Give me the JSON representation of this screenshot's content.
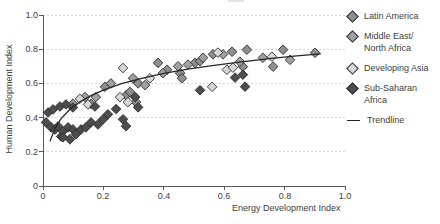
{
  "axes": {
    "x_title": "Energy Development Index",
    "y_title": "Human Development Index",
    "x_ticks": [
      "0",
      "0.2",
      "0.4",
      "0.6",
      "0.8",
      "1.0"
    ],
    "y_ticks": [
      "1.0",
      "0.8",
      "0.6",
      "0.4",
      "0.2",
      "0"
    ]
  },
  "legend": {
    "items": [
      {
        "label": "Latin America",
        "color": "#8e8e8e",
        "marker": "diamond"
      },
      {
        "label": "Middle East/\nNorth Africa",
        "color": "#a0a0a0",
        "marker": "diamond"
      },
      {
        "label": "Developing Asia",
        "color": "#d7d7d7",
        "marker": "diamond"
      },
      {
        "label": "Sub-Saharan\nAfrica",
        "color": "#4d4d4d",
        "marker": "diamond"
      },
      {
        "label": "Trendline",
        "color": "#262626",
        "marker": "line"
      }
    ]
  },
  "colors": {
    "axis": "#595959",
    "gridline": "#d8d8d8",
    "point_border": "#2e2e2e",
    "trendline": "#262626",
    "text": "#404040"
  },
  "chart_data": {
    "type": "scatter",
    "title": "",
    "xlabel": "Energy Development Index",
    "ylabel": "Human Development Index",
    "xlim": [
      0,
      1.0
    ],
    "ylim": [
      0,
      1.0
    ],
    "x_tick_values": [
      0,
      0.2,
      0.4,
      0.6,
      0.8,
      1.0
    ],
    "y_tick_values": [
      0,
      0.2,
      0.4,
      0.6,
      0.8,
      1.0
    ],
    "grid": "horizontal-dashed",
    "legend_position": "right",
    "marker": "diamond",
    "series": [
      {
        "name": "Latin America",
        "color": "#8e8e8e",
        "points": [
          [
            0.159,
            0.48
          ],
          [
            0.205,
            0.58
          ],
          [
            0.275,
            0.53
          ],
          [
            0.288,
            0.55
          ],
          [
            0.308,
            0.49
          ],
          [
            0.315,
            0.6
          ],
          [
            0.381,
            0.72
          ],
          [
            0.411,
            0.68
          ],
          [
            0.454,
            0.66
          ],
          [
            0.46,
            0.63
          ],
          [
            0.503,
            0.72
          ],
          [
            0.52,
            0.73
          ],
          [
            0.563,
            0.77
          ],
          [
            0.626,
            0.785
          ],
          [
            0.662,
            0.698
          ],
          [
            0.675,
            0.797
          ],
          [
            0.762,
            0.698
          ],
          [
            0.795,
            0.797
          ],
          [
            0.901,
            0.779
          ]
        ]
      },
      {
        "name": "Middle East/North Africa",
        "color": "#a0a0a0",
        "points": [
          [
            0.099,
            0.48
          ],
          [
            0.139,
            0.52
          ],
          [
            0.175,
            0.52
          ],
          [
            0.225,
            0.6
          ],
          [
            0.298,
            0.63
          ],
          [
            0.338,
            0.59
          ],
          [
            0.397,
            0.66
          ],
          [
            0.447,
            0.7
          ],
          [
            0.48,
            0.71
          ],
          [
            0.53,
            0.75
          ],
          [
            0.596,
            0.77
          ],
          [
            0.652,
            0.727
          ],
          [
            0.728,
            0.75
          ],
          [
            0.818,
            0.738
          ]
        ]
      },
      {
        "name": "Developing Asia",
        "color": "#d7d7d7",
        "points": [
          [
            0.122,
            0.51
          ],
          [
            0.149,
            0.477
          ],
          [
            0.255,
            0.52
          ],
          [
            0.281,
            0.49
          ],
          [
            0.265,
            0.69
          ],
          [
            0.354,
            0.63
          ],
          [
            0.56,
            0.58
          ],
          [
            0.579,
            0.78
          ],
          [
            0.609,
            0.68
          ],
          [
            0.629,
            0.692
          ],
          [
            0.758,
            0.756
          ]
        ]
      },
      {
        "name": "Sub-Saharan Africa",
        "color": "#4d4d4d",
        "points": [
          [
            0.01,
            0.372
          ],
          [
            0.017,
            0.43
          ],
          [
            0.027,
            0.343
          ],
          [
            0.033,
            0.448
          ],
          [
            0.04,
            0.33
          ],
          [
            0.05,
            0.349
          ],
          [
            0.056,
            0.465
          ],
          [
            0.06,
            0.29
          ],
          [
            0.066,
            0.32
          ],
          [
            0.066,
            0.285
          ],
          [
            0.076,
            0.477
          ],
          [
            0.083,
            0.343
          ],
          [
            0.089,
            0.273
          ],
          [
            0.099,
            0.331
          ],
          [
            0.099,
            0.459
          ],
          [
            0.109,
            0.302
          ],
          [
            0.126,
            0.331
          ],
          [
            0.142,
            0.343
          ],
          [
            0.159,
            0.372
          ],
          [
            0.172,
            0.465
          ],
          [
            0.182,
            0.36
          ],
          [
            0.199,
            0.39
          ],
          [
            0.215,
            0.419
          ],
          [
            0.242,
            0.45
          ],
          [
            0.265,
            0.39
          ],
          [
            0.275,
            0.35
          ],
          [
            0.305,
            0.52
          ],
          [
            0.315,
            0.46
          ],
          [
            0.52,
            0.56
          ],
          [
            0.636,
            0.634
          ],
          [
            0.662,
            0.651
          ],
          [
            0.669,
            0.581
          ]
        ]
      }
    ],
    "trendline": {
      "name": "Trendline",
      "color": "#262626",
      "points": [
        [
          0.023,
          0.261
        ],
        [
          0.04,
          0.338
        ],
        [
          0.06,
          0.394
        ],
        [
          0.09,
          0.45
        ],
        [
          0.12,
          0.49
        ],
        [
          0.16,
          0.53
        ],
        [
          0.2,
          0.561
        ],
        [
          0.26,
          0.598
        ],
        [
          0.33,
          0.631
        ],
        [
          0.4,
          0.658
        ],
        [
          0.48,
          0.683
        ],
        [
          0.56,
          0.704
        ],
        [
          0.65,
          0.725
        ],
        [
          0.75,
          0.745
        ],
        [
          0.84,
          0.761
        ],
        [
          0.92,
          0.773
        ]
      ]
    }
  }
}
